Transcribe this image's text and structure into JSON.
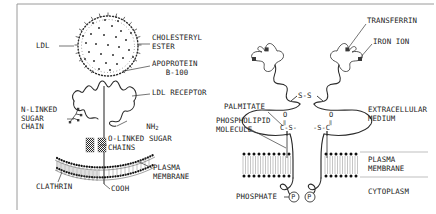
{
  "figure": {
    "border_color": "#9a9a9a",
    "ink_color": "#1c1c1c",
    "leader_color": "#8c8c8c"
  },
  "left_panel": {
    "name": "ldl-receptor-diagram",
    "labels": {
      "ldl": "LDL",
      "cholesteryl_ester": "CHOLESTERYL\nESTER",
      "apoprotein": "APOPROTEIN\n   B-100",
      "ldl_receptor": "LDL RECEPTOR",
      "nh2": "NH",
      "nh2_sub": "2",
      "n_linked": "N-LINKED\nSUGAR\nCHAIN",
      "o_linked": "O-LINKED SUGAR\nCHAINS",
      "plasma_membrane": "PLASMA\nMEMBRANE",
      "clathrin": "CLATHRIN",
      "cooh": "COOH"
    }
  },
  "right_panel": {
    "name": "transferrin-receptor-diagram",
    "labels": {
      "transferrin": "TRANSFERRIN",
      "iron_ion": "IRON ION",
      "ss_bond": "S-S",
      "palmitate": "PALMITATE",
      "phospholipid": "PHOSPHOLIPID\nMOLECULE",
      "extracellular": "EXTRACELLULAR\nMEDIUM",
      "plasma_membrane": "PLASMA\nMEMBRANE",
      "cytoplasm": "CYTOPLASM",
      "phosphate": "PHOSPHATE",
      "phosphate_symbol": "P",
      "palmitate_left_o": "O",
      "palmitate_left_bond": "‖",
      "palmitate_left_chain": "C-S-",
      "palmitate_right_o": "O",
      "palmitate_right_bond": "‖",
      "palmitate_right_chain": "-S-C"
    }
  }
}
